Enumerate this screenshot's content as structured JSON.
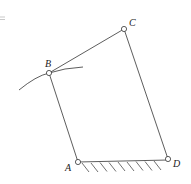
{
  "diagram": {
    "type": "four-bar linkage",
    "colors": {
      "line": "#333333",
      "background": "#ffffff"
    },
    "joints": [
      {
        "id": "A",
        "label": "A",
        "x": 78,
        "y": 162,
        "label_x": 65,
        "label_y": 171
      },
      {
        "id": "B",
        "label": "B",
        "x": 49,
        "y": 73,
        "label_x": 45,
        "label_y": 67
      },
      {
        "id": "C",
        "label": "C",
        "x": 124,
        "y": 29,
        "label_x": 129,
        "label_y": 26
      },
      {
        "id": "D",
        "label": "D",
        "x": 168,
        "y": 159,
        "label_x": 173,
        "label_y": 167
      }
    ],
    "links": [
      [
        "A",
        "B"
      ],
      [
        "B",
        "C"
      ],
      [
        "C",
        "D"
      ],
      [
        "A",
        "D"
      ]
    ],
    "ground": {
      "between": [
        "A",
        "D"
      ],
      "hatch_count": 9
    },
    "arc": {
      "through": "B"
    },
    "margin_mark": "="
  }
}
